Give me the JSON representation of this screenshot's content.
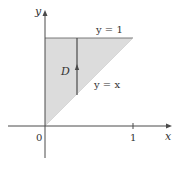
{
  "diagram": {
    "axes": {
      "x_label": "x",
      "y_label": "y",
      "origin_label": "0",
      "x_tick_label": "1"
    },
    "region": {
      "label": "D",
      "fill": "#dcdcdc",
      "edge": "#4a4a4a"
    },
    "curves": {
      "top_label": "y = 1",
      "diagonal_label": "y = x"
    },
    "colors": {
      "axis": "#4a4a4a",
      "text": "#333333"
    }
  }
}
